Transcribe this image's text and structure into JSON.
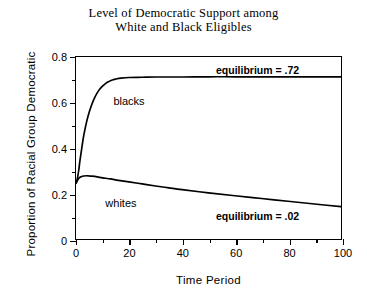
{
  "chart_data": {
    "type": "line",
    "title": "Level of Democratic Support among White and Black Eligibles",
    "title_lines": [
      "Level of Democratic Support among",
      "White and Black Eligibles"
    ],
    "xlabel": "Time Period",
    "ylabel": "Proportion of Racial Group Democratic",
    "xlim": [
      0,
      100
    ],
    "ylim": [
      0,
      0.8
    ],
    "grid": false,
    "legend": "inline-labels",
    "xticks": [
      0,
      20,
      40,
      60,
      80,
      100
    ],
    "xtick_labels": [
      "0",
      "20",
      "40",
      "60",
      "80",
      "100"
    ],
    "xticks_minor": [
      10,
      30,
      50,
      70,
      90
    ],
    "yticks": [
      0,
      0.2,
      0.4,
      0.6,
      0.8
    ],
    "ytick_labels": [
      "0",
      "0.2",
      "0.4",
      "0.6",
      "0.8"
    ],
    "yticks_minor": [
      0.1,
      0.3,
      0.5,
      0.7
    ],
    "series": [
      {
        "name": "blacks",
        "label": "blacks",
        "color": "#000000",
        "x": [
          0,
          0.5,
          1,
          1.5,
          2,
          2.5,
          3,
          4,
          5,
          6,
          7,
          8,
          9,
          10,
          11,
          12,
          13,
          14,
          15,
          17,
          20,
          25,
          30,
          40,
          50,
          60,
          70,
          80,
          90,
          100
        ],
        "values": [
          0.245,
          0.265,
          0.3,
          0.345,
          0.385,
          0.425,
          0.46,
          0.515,
          0.558,
          0.592,
          0.62,
          0.642,
          0.659,
          0.672,
          0.682,
          0.69,
          0.696,
          0.7,
          0.703,
          0.707,
          0.71,
          0.711,
          0.712,
          0.712,
          0.713,
          0.713,
          0.713,
          0.713,
          0.713,
          0.713
        ]
      },
      {
        "name": "whites",
        "label": "whites",
        "color": "#000000",
        "x": [
          0,
          1,
          2,
          3,
          4,
          5,
          6,
          8,
          10,
          13,
          16,
          20,
          25,
          30,
          35,
          40,
          50,
          60,
          70,
          80,
          90,
          100
        ],
        "values": [
          0.245,
          0.266,
          0.274,
          0.277,
          0.278,
          0.277,
          0.276,
          0.273,
          0.269,
          0.264,
          0.258,
          0.251,
          0.242,
          0.233,
          0.225,
          0.217,
          0.203,
          0.19,
          0.178,
          0.166,
          0.154,
          0.142
        ]
      }
    ],
    "annotations": [
      {
        "id": "eq-blacks",
        "text": "equilibrium = .72",
        "x": 68,
        "y": 0.745
      },
      {
        "id": "eq-whites",
        "text": "equilibrium = .02",
        "x": 68,
        "y": 0.108
      }
    ],
    "series_labels": [
      {
        "id": "label-blacks",
        "text": "blacks",
        "x": 14,
        "y": 0.635
      },
      {
        "id": "label-whites",
        "text": "whites",
        "x": 11,
        "y": 0.192
      }
    ]
  }
}
